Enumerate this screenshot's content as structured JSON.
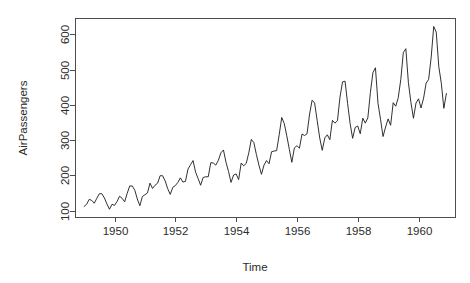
{
  "chart_data": {
    "type": "line",
    "title": "",
    "subtitle": "",
    "xlabel": "Time",
    "ylabel": "AirPassengers",
    "grid": false,
    "legend": false,
    "legend_position": "none",
    "line_color": "#1a1a1a",
    "axis_color": "#4d4d4d",
    "background_color": "#ffffff",
    "xlim": [
      1948.7,
      1961.2
    ],
    "ylim": [
      82,
      646
    ],
    "xticks": [
      1950,
      1952,
      1954,
      1956,
      1958,
      1960
    ],
    "xtick_labels": [
      "1950",
      "1952",
      "1954",
      "1956",
      "1958",
      "1960"
    ],
    "yticks": [
      100,
      200,
      300,
      400,
      500,
      600
    ],
    "ytick_labels": [
      "100",
      "200",
      "300",
      "400",
      "500",
      "600"
    ],
    "series_name": "AirPassengers",
    "x_start": 1949.0,
    "x_step": 0.0833333,
    "x": [
      1949.0,
      1949.083,
      1949.167,
      1949.25,
      1949.333,
      1949.417,
      1949.5,
      1949.583,
      1949.667,
      1949.75,
      1949.833,
      1949.917,
      1950.0,
      1950.083,
      1950.167,
      1950.25,
      1950.333,
      1950.417,
      1950.5,
      1950.583,
      1950.667,
      1950.75,
      1950.833,
      1950.917,
      1951.0,
      1951.083,
      1951.167,
      1951.25,
      1951.333,
      1951.417,
      1951.5,
      1951.583,
      1951.667,
      1951.75,
      1951.833,
      1951.917,
      1952.0,
      1952.083,
      1952.167,
      1952.25,
      1952.333,
      1952.417,
      1952.5,
      1952.583,
      1952.667,
      1952.75,
      1952.833,
      1952.917,
      1953.0,
      1953.083,
      1953.167,
      1953.25,
      1953.333,
      1953.417,
      1953.5,
      1953.583,
      1953.667,
      1953.75,
      1953.833,
      1953.917,
      1954.0,
      1954.083,
      1954.167,
      1954.25,
      1954.333,
      1954.417,
      1954.5,
      1954.583,
      1954.667,
      1954.75,
      1954.833,
      1954.917,
      1955.0,
      1955.083,
      1955.167,
      1955.25,
      1955.333,
      1955.417,
      1955.5,
      1955.583,
      1955.667,
      1955.75,
      1955.833,
      1955.917,
      1956.0,
      1956.083,
      1956.167,
      1956.25,
      1956.333,
      1956.417,
      1956.5,
      1956.583,
      1956.667,
      1956.75,
      1956.833,
      1956.917,
      1957.0,
      1957.083,
      1957.167,
      1957.25,
      1957.333,
      1957.417,
      1957.5,
      1957.583,
      1957.667,
      1957.75,
      1957.833,
      1957.917,
      1958.0,
      1958.083,
      1958.167,
      1958.25,
      1958.333,
      1958.417,
      1958.5,
      1958.583,
      1958.667,
      1958.75,
      1958.833,
      1958.917,
      1959.0,
      1959.083,
      1959.167,
      1959.25,
      1959.333,
      1959.417,
      1959.5,
      1959.583,
      1959.667,
      1959.75,
      1959.833,
      1959.917,
      1960.0,
      1960.083,
      1960.167,
      1960.25,
      1960.333,
      1960.417,
      1960.5,
      1960.583,
      1960.667,
      1960.75,
      1960.833,
      1960.917
    ],
    "values": [
      112,
      118,
      132,
      129,
      121,
      135,
      148,
      148,
      136,
      119,
      104,
      118,
      115,
      126,
      141,
      135,
      125,
      149,
      170,
      170,
      158,
      133,
      114,
      140,
      145,
      150,
      178,
      163,
      172,
      178,
      199,
      199,
      184,
      162,
      146,
      166,
      171,
      180,
      193,
      181,
      183,
      218,
      230,
      242,
      209,
      191,
      172,
      194,
      196,
      196,
      236,
      235,
      229,
      243,
      264,
      272,
      237,
      211,
      180,
      201,
      204,
      188,
      235,
      227,
      234,
      264,
      302,
      293,
      259,
      229,
      203,
      229,
      242,
      233,
      267,
      269,
      270,
      315,
      364,
      347,
      312,
      274,
      237,
      278,
      284,
      277,
      317,
      313,
      318,
      374,
      413,
      405,
      355,
      306,
      271,
      306,
      315,
      301,
      356,
      348,
      355,
      422,
      465,
      467,
      404,
      347,
      305,
      336,
      340,
      318,
      362,
      348,
      363,
      435,
      491,
      505,
      404,
      359,
      310,
      337,
      360,
      342,
      406,
      396,
      420,
      472,
      548,
      559,
      463,
      407,
      362,
      405,
      417,
      391,
      419,
      461,
      472,
      535,
      622,
      606,
      508,
      461,
      390,
      432
    ]
  },
  "plot_geometry": {
    "box_left": 75,
    "box_right": 455,
    "box_top": 18,
    "box_bottom": 217,
    "tick_length": 5
  }
}
